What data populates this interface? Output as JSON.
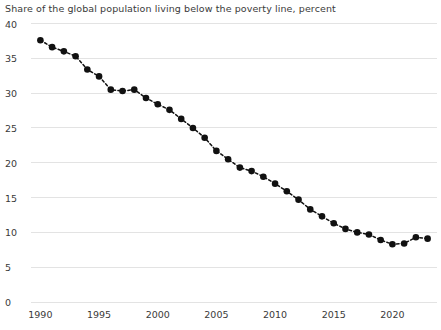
{
  "chart_data": {
    "type": "line",
    "title": "Share of the global population living below the poverty line, percent",
    "subtitle": "",
    "xlabel": "",
    "ylabel": "",
    "grid": true,
    "legend": null,
    "marker": "filled-circle",
    "line_style": "dashed",
    "series_color": "#111111",
    "grid_color": "#e3e3e3",
    "xlim": [
      1989.2,
      2023.8
    ],
    "ylim": [
      0,
      40
    ],
    "ytick_values": [
      0,
      5,
      10,
      15,
      20,
      25,
      30,
      35,
      40
    ],
    "ytick_labels": [
      "0",
      "5",
      "10",
      "15",
      "20",
      "25",
      "30",
      "35",
      "40"
    ],
    "xtick_values": [
      1990,
      1995,
      2000,
      2005,
      2010,
      2015,
      2020
    ],
    "xtick_labels": [
      "1990",
      "1995",
      "2000",
      "2005",
      "2010",
      "2015",
      "2020"
    ],
    "x": [
      1990,
      1991,
      1992,
      1993,
      1994,
      1995,
      1996,
      1997,
      1998,
      1999,
      2000,
      2001,
      2002,
      2003,
      2004,
      2005,
      2006,
      2007,
      2008,
      2009,
      2010,
      2011,
      2012,
      2013,
      2014,
      2015,
      2016,
      2017,
      2018,
      2019,
      2020,
      2021,
      2022,
      2023
    ],
    "values": [
      37.6,
      36.6,
      36.0,
      35.3,
      33.4,
      32.4,
      30.5,
      30.3,
      30.5,
      29.3,
      28.4,
      27.6,
      26.3,
      25.0,
      23.6,
      21.7,
      20.5,
      19.3,
      18.8,
      18.0,
      17.0,
      15.9,
      14.7,
      13.3,
      12.3,
      11.3,
      10.5,
      10.0,
      9.7,
      8.9,
      8.3,
      8.4,
      9.3,
      9.1
    ],
    "series_name": "Share below poverty line",
    "value_unit": "percent",
    "point_count": 34
  }
}
